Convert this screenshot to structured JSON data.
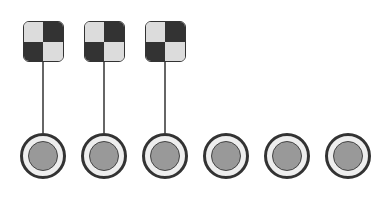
{
  "board": {
    "holes": [
      {
        "x": 43,
        "flagged": true
      },
      {
        "x": 104,
        "flagged": true
      },
      {
        "x": 165,
        "flagged": true
      },
      {
        "x": 226,
        "flagged": false
      },
      {
        "x": 287,
        "flagged": false
      },
      {
        "x": 348,
        "flagged": false
      }
    ],
    "hole_y": 156,
    "flag_top": 21,
    "icons": {
      "flag": "checkered-flag-icon",
      "hole": "hole-icon"
    },
    "colors": {
      "flag_dark": "#333333",
      "flag_light": "#dcdcdc",
      "hole_ring": "#eeeeee",
      "hole_center": "#999999",
      "pole": "#666666"
    }
  }
}
